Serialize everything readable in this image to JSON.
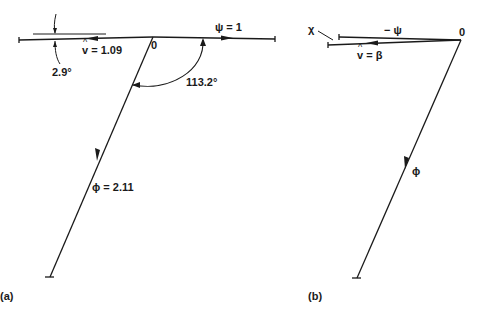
{
  "panels": [
    {
      "id": "a",
      "caption": "(a)",
      "origin_label": "0",
      "vectors": [
        {
          "name": "psi",
          "label": "ψ = 1",
          "direction": "right"
        },
        {
          "name": "v_hat",
          "symbol": "v",
          "label_rest": " = 1.09",
          "direction": "left"
        },
        {
          "name": "phi",
          "label": "ϕ = 2.11",
          "direction": "down-left"
        }
      ],
      "angles": [
        {
          "label": "2.9°",
          "between": "v_hat and horizontal axis"
        },
        {
          "label": "113.2°",
          "between": "psi and phi"
        }
      ]
    },
    {
      "id": "b",
      "caption": "(b)",
      "origin_label": "0",
      "vectors": [
        {
          "name": "minus_psi",
          "label": "− ψ",
          "direction": "left"
        },
        {
          "name": "v_hat_beta",
          "symbol": "v",
          "label_rest": " = β",
          "direction": "left"
        },
        {
          "name": "phi",
          "label": "ϕ",
          "direction": "down-left"
        }
      ],
      "annotations": [
        {
          "label": "χ",
          "points_to": "gap between −ψ and v̂ tips"
        }
      ]
    }
  ],
  "colors": {
    "ink": "#1a1a1a",
    "background": "#ffffff"
  }
}
